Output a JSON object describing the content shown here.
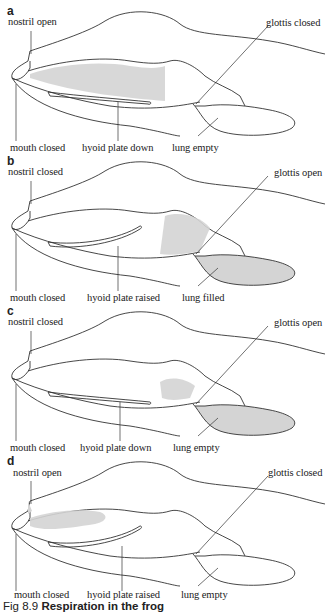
{
  "figure": {
    "caption_number": "Fig 8.9",
    "caption_title": "Respiration in the frog"
  },
  "panels": [
    {
      "id": "a",
      "labels": {
        "nostril": "nostril open",
        "mouth": "mouth closed",
        "hyoid": "hyoid plate down",
        "lung": "lung empty",
        "glottis": "glottis closed"
      },
      "shaded_region": "buccal cavity"
    },
    {
      "id": "b",
      "labels": {
        "nostril": "nostril closed",
        "mouth": "mouth closed",
        "hyoid": "hyoid plate raised",
        "lung": "lung filled",
        "glottis": "glottis open"
      },
      "shaded_region": "lung"
    },
    {
      "id": "c",
      "labels": {
        "nostril": "nostril closed",
        "mouth": "mouth closed",
        "hyoid": "hyoid plate down",
        "lung": "lung empty",
        "glottis": "glottis open"
      },
      "shaded_region": "lung"
    },
    {
      "id": "d",
      "labels": {
        "nostril": "nostril open",
        "mouth": "mouth closed",
        "hyoid": "hyoid plate raised",
        "lung": "lung empty",
        "glottis": "glottis closed"
      },
      "shaded_region": "buccal cavity"
    }
  ],
  "colors": {
    "line": "#333333",
    "shading": "#cfcfcf"
  }
}
